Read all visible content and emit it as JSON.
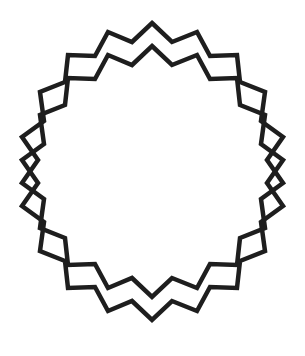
{
  "figure": {
    "stroke_color": "#1e1e1e",
    "background": "#ffffff",
    "stroke_width": 4.5,
    "offset_y": 23,
    "shapes": [
      {
        "name": "upper-star",
        "dy": 0
      },
      {
        "name": "lower-star",
        "dy": 23
      }
    ],
    "points": "152,23 172,42 197,32 210,56 237,55 240,82 265,92 261,121 283,137 267,160 283,183 261,199 265,228 240,238 237,265 210,264 197,288 172,278 152,297 132,278 108,288 95,264 68,265 65,238 40,228 44,199 22,183 38,160 22,137 44,121 40,92 65,82 68,55 95,56 108,32 132,42"
  }
}
